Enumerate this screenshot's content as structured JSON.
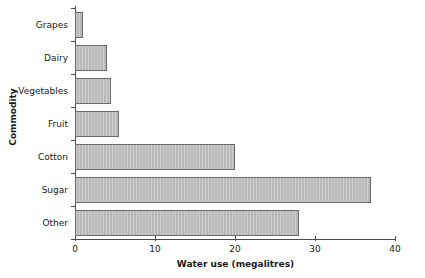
{
  "chart_data": {
    "type": "bar",
    "orientation": "horizontal",
    "title": "",
    "xlabel": "Water use (megalitres)",
    "ylabel": "Commodity",
    "categories": [
      "Grapes",
      "Dairy",
      "Vegetables",
      "Fruit",
      "Cotton",
      "Sugar",
      "Other"
    ],
    "values": [
      1,
      4,
      4.5,
      5.5,
      20,
      37,
      28
    ],
    "xlim": [
      0,
      40
    ],
    "xticks": [
      0,
      10,
      20,
      30,
      40
    ],
    "xtick_labels": [
      "0",
      "10",
      "20",
      "30",
      "40"
    ],
    "grid": false,
    "legend": null,
    "bar_fill_color": "#b9b9b9",
    "bar_edge_color": "#6b6b6b",
    "axis_color": "#4d4d4d",
    "text_color": "#1a1a1a"
  }
}
